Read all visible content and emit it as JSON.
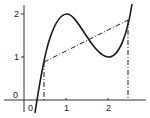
{
  "diagram": {
    "x_ticks": [
      {
        "value": 1,
        "label": "1"
      },
      {
        "value": 2,
        "label": "2"
      }
    ],
    "y_ticks": [
      {
        "value": 1,
        "label": "1"
      },
      {
        "value": 2,
        "label": "2"
      }
    ],
    "origin_labels": {
      "x_origin": "0",
      "y_origin": "0"
    },
    "curve": {
      "local_max": [
        1,
        2
      ],
      "local_min": [
        2,
        1
      ]
    },
    "secant": {
      "left_point": [
        0.45,
        0.88
      ],
      "right_point": [
        2.5,
        1.86
      ]
    },
    "colors": {
      "stroke": "#1a1a1a",
      "background": "#ffffff"
    }
  }
}
